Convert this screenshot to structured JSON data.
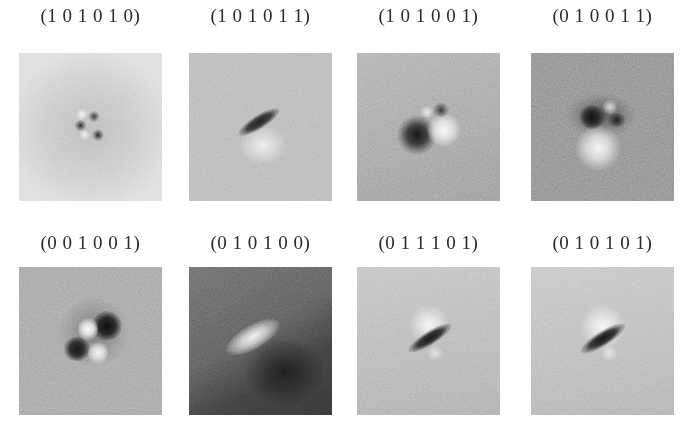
{
  "figure": {
    "panels": [
      {
        "label": "(1 0 1 0 1 0)",
        "row": 0,
        "col": 0,
        "background": "#cfcfcf",
        "pattern": "quadrupole-small"
      },
      {
        "label": "(1 0 1 0 1 1)",
        "row": 0,
        "col": 1,
        "background": "#b9b9b9",
        "pattern": "dark-diagonal-bar-with-light-below"
      },
      {
        "label": "(1 0 1 0 0 1)",
        "row": 0,
        "col": 2,
        "background": "#a8a8a8",
        "pattern": "dark-left-light-right-dipole"
      },
      {
        "label": "(0 1 0 0 1 1)",
        "row": 0,
        "col": 3,
        "background": "#8f8f8f",
        "pattern": "dark-top-light-bottom-dipole"
      },
      {
        "label": "(0 0 1 0 0 1)",
        "row": 1,
        "col": 0,
        "background": "#a6a6a6",
        "pattern": "quadrupole-large"
      },
      {
        "label": "(0 1 0 1 0 0)",
        "row": 1,
        "col": 1,
        "background": "#5e5e5e",
        "pattern": "light-diagonal-bar-dark-below"
      },
      {
        "label": "(0 1 1 1 0 1)",
        "row": 1,
        "col": 2,
        "background": "#b8b8b8",
        "pattern": "dark-diagonal-bar-light-above"
      },
      {
        "label": "(0 1 0 1 0 1)",
        "row": 1,
        "col": 3,
        "background": "#bcbcbc",
        "pattern": "dark-diagonal-bar-light-above"
      }
    ]
  }
}
